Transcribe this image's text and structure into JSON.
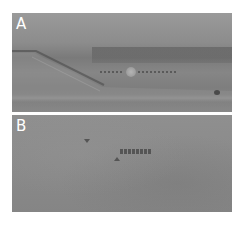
{
  "figure": {
    "panels": [
      {
        "id": "A",
        "label": "A",
        "description": "grayscale ultrasound-like image with sloping layer, bright spot and dotted marker line"
      },
      {
        "id": "B",
        "label": "B",
        "description": "grayscale ultrasound-like image with arrowheads and dotted marker line"
      }
    ],
    "colors": {
      "label_text": "#ffffff",
      "panel_gray": "#8a8a8a",
      "background": "#ffffff"
    }
  }
}
